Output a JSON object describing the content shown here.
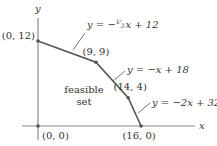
{
  "axes": {
    "x_label": "x",
    "y_label": "y",
    "x_range": [
      0,
      22
    ],
    "y_range": [
      0,
      17
    ]
  },
  "region_label": [
    "feasible",
    "set"
  ],
  "vertices": [
    {
      "x": 0,
      "y": 0,
      "label": "(0, 0)"
    },
    {
      "x": 0,
      "y": 12,
      "label": "(0, 12)"
    },
    {
      "x": 9,
      "y": 9,
      "label": "(9, 9)"
    },
    {
      "x": 14,
      "y": 4,
      "label": "(14, 4)"
    },
    {
      "x": 16,
      "y": 0,
      "label": "(16, 0)"
    }
  ],
  "constraints": [
    {
      "label_prefix": "y = −",
      "frac_num": "1",
      "frac_den": "3",
      "label_suffix": "x + 12"
    },
    {
      "label": "y = −x + 18"
    },
    {
      "label": "y = −2x + 32"
    }
  ],
  "colors": {
    "edge": "#555555",
    "axis": "#8a8a8a",
    "text": "#333333"
  }
}
